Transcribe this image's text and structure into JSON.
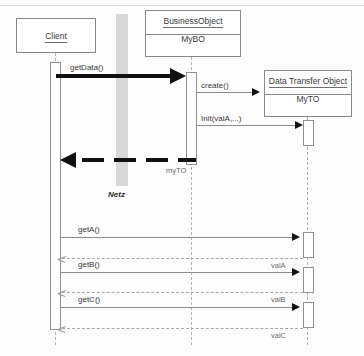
{
  "diagram": {
    "type": "uml-sequence-diagram",
    "participants": [
      {
        "id": "client",
        "title": "Client",
        "instance": "",
        "x": 16,
        "y": 18,
        "w": 80,
        "h": 35,
        "lifeline_x": 55
      },
      {
        "id": "business_object",
        "title": "BusinessObject",
        "instance": "MyBO",
        "x": 145,
        "y": 10,
        "w": 96,
        "h": 47,
        "lifeline_x": 191
      },
      {
        "id": "data_transfer_object",
        "title": "Data Transfer Object",
        "instance": "MyTO",
        "x": 264,
        "y": 70,
        "w": 88,
        "h": 47,
        "lifeline_x": 307
      }
    ],
    "network_band": {
      "label": "Netz",
      "x": 116,
      "y": 14,
      "w": 12,
      "h": 172,
      "color": "#d7d7d7"
    },
    "messages": [
      {
        "id": "m1",
        "label": "getData()",
        "from": "client",
        "to": "business_object",
        "kind": "call",
        "style": "thick-solid",
        "y": 76
      },
      {
        "id": "m2",
        "label": "create()",
        "from": "business_object",
        "to": "data_transfer_object",
        "kind": "call",
        "style": "thin-solid",
        "y": 92
      },
      {
        "id": "m3",
        "label": "Init(valA,...)",
        "from": "business_object",
        "to": "data_transfer_object",
        "kind": "call",
        "style": "thin-solid",
        "y": 125
      },
      {
        "id": "m4",
        "label": "myTO",
        "from": "business_object",
        "to": "client",
        "kind": "return",
        "style": "thick-dashed",
        "y": 160
      },
      {
        "id": "m5",
        "label": "getA()",
        "from": "client",
        "to": "data_transfer_object",
        "kind": "call",
        "style": "thin-solid",
        "y": 237
      },
      {
        "id": "m6",
        "label": "valA",
        "from": "data_transfer_object",
        "to": "client",
        "kind": "return",
        "style": "thin-dashed",
        "y": 258
      },
      {
        "id": "m7",
        "label": "getB()",
        "from": "client",
        "to": "data_transfer_object",
        "kind": "call",
        "style": "thin-solid",
        "y": 272
      },
      {
        "id": "m8",
        "label": "valB",
        "from": "data_transfer_object",
        "to": "client",
        "kind": "return",
        "style": "thin-dashed",
        "y": 292
      },
      {
        "id": "m9",
        "label": "getC()",
        "from": "client",
        "to": "data_transfer_object",
        "kind": "call",
        "style": "thin-solid",
        "y": 307
      },
      {
        "id": "m10",
        "label": "valC",
        "from": "data_transfer_object",
        "to": "client",
        "kind": "return",
        "style": "thin-dashed",
        "y": 328
      }
    ],
    "labels": {
      "getData": "getData()",
      "create": "create()",
      "init": "Init(valA,...)",
      "myTO": "myTO",
      "getA": "getA()",
      "valA": "valA",
      "getB": "getB()",
      "valB": "valB",
      "getC": "getC()",
      "valC": "valC",
      "netz": "Netz"
    },
    "colors": {
      "line": "#8d8d8d",
      "lifeline": "#b0b0b0",
      "bold": "#111111",
      "band": "#d7d7d7",
      "text": "#3a3a3a"
    }
  }
}
